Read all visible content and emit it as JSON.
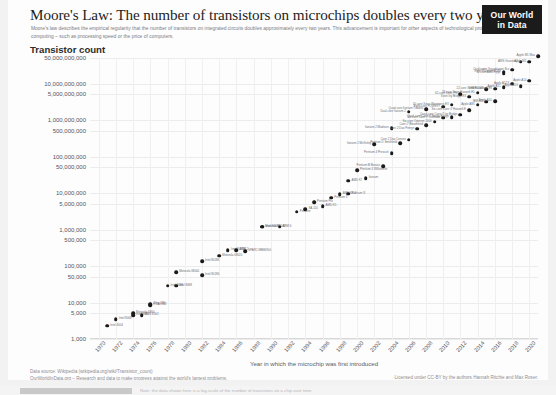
{
  "header": {
    "title": "Moore's Law: The number of transistors on microchips doubles every two years",
    "subtitle": "Moore's law describes the empirical regularity that the number of transistors on integrated circuits doubles approximately every two years. This advancement is important for other aspects of technological progress in computing – such as processing speed or the price of computers.",
    "logo_line1": "Our World",
    "logo_line2": "in Data"
  },
  "footer": {
    "source": "Data source: Wikipedia (wikipedia.org/wiki/Transistor_count)",
    "owid": "OurWorldInData.org – Research and data to make progress against the world's largest problems.",
    "license": "Licensed under CC-BY by the authors Hannah Ritchie and Max Roser.",
    "cut_text": "Note: the data shown here is a log-scale of the number of transistors on a chip over time"
  },
  "chart_data": {
    "type": "scatter",
    "title": "Moore's Law: The number of transistors on microchips doubles every two years",
    "ylabel": "Transistor count",
    "xlabel": "Year in which the microchip was first introduced",
    "y_scale": "log",
    "ylim": [
      1000,
      50000000000
    ],
    "xlim": [
      1969,
      2021
    ],
    "grid": true,
    "legend": "none",
    "ytick_labels": [
      "50,000,000,000",
      "10,000,000,000",
      "5,000,000,000",
      "1,000,000,000",
      "500,000,000",
      "100,000,000",
      "50,000,000",
      "10,000,000",
      "5,000,000",
      "1,000,000",
      "500,000",
      "100,000",
      "50,000",
      "10,000",
      "5,000",
      "1,000"
    ],
    "ytick_values": [
      50000000000,
      10000000000,
      5000000000,
      1000000000,
      500000000,
      100000000,
      50000000,
      10000000,
      5000000,
      1000000,
      500000,
      100000,
      50000,
      10000,
      5000,
      1000
    ],
    "xtick_labels": [
      "1970",
      "1972",
      "1974",
      "1976",
      "1978",
      "1980",
      "1982",
      "1984",
      "1986",
      "1988",
      "1990",
      "1992",
      "1994",
      "1996",
      "1998",
      "2000",
      "2002",
      "2004",
      "2006",
      "2008",
      "2010",
      "2012",
      "2014",
      "2016",
      "2018",
      "2020"
    ],
    "points": [
      {
        "x": 1971,
        "y": 2300,
        "label": "Intel 4004"
      },
      {
        "x": 1972,
        "y": 3500,
        "label": "Intel 8008"
      },
      {
        "x": 1974,
        "y": 4500,
        "label": "Intel 8080"
      },
      {
        "x": 1974,
        "y": 5000,
        "label": "Motorola 6800"
      },
      {
        "x": 1975,
        "y": 4528,
        "label": "MOS 6502"
      },
      {
        "x": 1976,
        "y": 8500,
        "label": "RCA 1802"
      },
      {
        "x": 1976,
        "y": 9000,
        "label": "Zilog Z80"
      },
      {
        "x": 1978,
        "y": 29000,
        "label": "Intel 8086"
      },
      {
        "x": 1979,
        "y": 29000,
        "label": "Intel 8088"
      },
      {
        "x": 1979,
        "y": 68000,
        "label": "Motorola 68000"
      },
      {
        "x": 1982,
        "y": 134000,
        "label": "Intel 80286"
      },
      {
        "x": 1982,
        "y": 55000,
        "label": "Intel 80186"
      },
      {
        "x": 1984,
        "y": 190000,
        "label": "Motorola 68020"
      },
      {
        "x": 1985,
        "y": 275000,
        "label": "Intel 80386"
      },
      {
        "x": 1986,
        "y": 273000,
        "label": "ARM 2"
      },
      {
        "x": 1987,
        "y": 250000,
        "label": "SPARC MB86900"
      },
      {
        "x": 1989,
        "y": 1180235,
        "label": "Intel 80486"
      },
      {
        "x": 1989,
        "y": 1200000,
        "label": "Motorola 68040"
      },
      {
        "x": 1991,
        "y": 1200000,
        "label": "ARM 6"
      },
      {
        "x": 1993,
        "y": 3100000,
        "label": "Pentium"
      },
      {
        "x": 1994,
        "y": 3600000,
        "label": "SA-110"
      },
      {
        "x": 1995,
        "y": 5500000,
        "label": "Pentium Pro"
      },
      {
        "x": 1996,
        "y": 4300000,
        "label": "AMD K5"
      },
      {
        "x": 1997,
        "y": 7500000,
        "label": "Pentium II"
      },
      {
        "x": 1998,
        "y": 9300000,
        "label": "AMD K6-2"
      },
      {
        "x": 1999,
        "y": 9500000,
        "label": "Pentium III"
      },
      {
        "x": 1999,
        "y": 22000000,
        "label": "AMD K7"
      },
      {
        "x": 2000,
        "y": 42000000,
        "label": "Pentium 4 Willamette"
      },
      {
        "x": 2001,
        "y": 25000000,
        "label": "Itanium"
      },
      {
        "x": 2002,
        "y": 220000000,
        "label": "Itanium 2 McKinley"
      },
      {
        "x": 2003,
        "y": 54300000,
        "label": "Pentium M Banias"
      },
      {
        "x": 2004,
        "y": 125000000,
        "label": "Pentium 4 Prescott"
      },
      {
        "x": 2004,
        "y": 592000000,
        "label": "Itanium 2 Madison"
      },
      {
        "x": 2005,
        "y": 228000000,
        "label": "Pentium D Smithfield"
      },
      {
        "x": 2006,
        "y": 291000000,
        "label": "Core 2 Duo Conroe"
      },
      {
        "x": 2006,
        "y": 1700000000,
        "label": "Dual-core Itanium 2"
      },
      {
        "x": 2007,
        "y": 582000000,
        "label": "Core 2 Duo Penryn"
      },
      {
        "x": 2008,
        "y": 731000000,
        "label": "Core i7 Bloomfield"
      },
      {
        "x": 2008,
        "y": 2000000000,
        "label": "Quad-core Itanium Tukwila"
      },
      {
        "x": 2009,
        "y": 904000000,
        "label": "Six-core Opteron 2400"
      },
      {
        "x": 2010,
        "y": 1170000000,
        "label": "Six-core Core i7 Gulftown"
      },
      {
        "x": 2010,
        "y": 2300000000,
        "label": "Eight-core POWER7"
      },
      {
        "x": 2011,
        "y": 1200000000,
        "label": "Quad-core Core i7 Sandy Bridge"
      },
      {
        "x": 2011,
        "y": 2600000000,
        "label": "10-core Xeon Westmere-EX"
      },
      {
        "x": 2012,
        "y": 1400000000,
        "label": "Quad-core Core i7 Ivy Bridge"
      },
      {
        "x": 2012,
        "y": 5000000000,
        "label": "62-core Xeon Phi"
      },
      {
        "x": 2013,
        "y": 1860000000,
        "label": "Six-core Core i7 Haswell-E"
      },
      {
        "x": 2013,
        "y": 4310000000,
        "label": "Xeon Ivy Bridge-EX"
      },
      {
        "x": 2014,
        "y": 2600000000,
        "label": "Apple A8X"
      },
      {
        "x": 2014,
        "y": 5560000000,
        "label": "18-core Xeon Haswell-E5"
      },
      {
        "x": 2015,
        "y": 3200000000,
        "label": "IBM z13"
      },
      {
        "x": 2015,
        "y": 7100000000,
        "label": "SPARC M7"
      },
      {
        "x": 2016,
        "y": 3300000000,
        "label": "Apple A10"
      },
      {
        "x": 2016,
        "y": 7200000000,
        "label": "22-core Xeon Broadwell-E5"
      },
      {
        "x": 2017,
        "y": 19200000000,
        "label": "32-core AMD Epyc"
      },
      {
        "x": 2017,
        "y": 8000000000,
        "label": "Apple A11"
      },
      {
        "x": 2017,
        "y": 21100000000,
        "label": "Xeon Platinum 8180"
      },
      {
        "x": 2018,
        "y": 10000000000,
        "label": "Apple A12X"
      },
      {
        "x": 2018,
        "y": 23600000000,
        "label": "Qualcomm Snapdragon 8cx"
      },
      {
        "x": 2019,
        "y": 39540000000,
        "label": "AWS Graviton2"
      },
      {
        "x": 2019,
        "y": 8500000000,
        "label": "Apple A13"
      },
      {
        "x": 2020,
        "y": 39540000000,
        "label": "Apple M1"
      },
      {
        "x": 2020,
        "y": 11800000000,
        "label": "Apple A14"
      },
      {
        "x": 2021,
        "y": 57000000000,
        "label": "Apple M1 Max"
      }
    ]
  }
}
